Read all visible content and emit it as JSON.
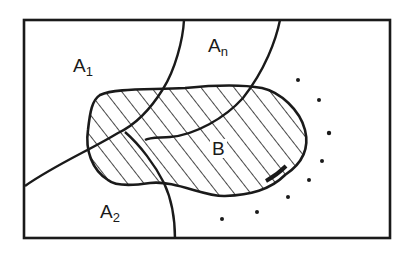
{
  "diagram": {
    "type": "venn-partition",
    "stroke_color": "#1a1a1a",
    "background_color": "#ffffff",
    "labels": {
      "a1": {
        "base": "A",
        "sub": "1"
      },
      "a2": {
        "base": "A",
        "sub": "2"
      },
      "an": {
        "base": "A",
        "sub": "n"
      },
      "b": {
        "text": "B"
      }
    },
    "ellipsis_dots": 6
  }
}
